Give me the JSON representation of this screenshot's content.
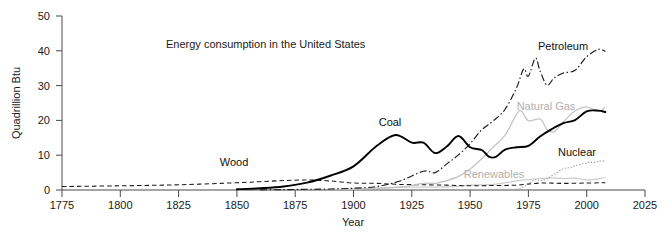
{
  "chart_data": {
    "type": "line",
    "title": "Energy consumption in the United States",
    "xlabel": "Year",
    "ylabel": "Quadrillion Btu",
    "xlim": [
      1775,
      2025
    ],
    "ylim": [
      0,
      50
    ],
    "xticks": [
      1775,
      1800,
      1825,
      1850,
      1875,
      1900,
      1925,
      1950,
      1975,
      2000,
      2025
    ],
    "yticks": [
      0,
      10,
      20,
      30,
      40,
      50
    ],
    "grid": false,
    "legend": "inline-annotations",
    "series": [
      {
        "name": "Wood",
        "label": "Wood",
        "style": "dashed",
        "color": "#1a1a1a",
        "x": [
          1775,
          1800,
          1825,
          1850,
          1860,
          1870,
          1880,
          1890,
          1900,
          1910,
          1920,
          1930,
          1940,
          1950,
          1960,
          1970,
          1980,
          1990,
          2000,
          2008
        ],
        "y": [
          1.0,
          1.2,
          1.5,
          2.1,
          2.4,
          2.7,
          2.9,
          2.6,
          2.0,
          1.9,
          1.6,
          1.5,
          1.4,
          1.2,
          1.3,
          1.4,
          2.0,
          1.9,
          2.0,
          2.1
        ]
      },
      {
        "name": "Coal",
        "label": "Coal",
        "style": "solid-thick",
        "color": "#000000",
        "x": [
          1850,
          1860,
          1870,
          1880,
          1890,
          1900,
          1910,
          1918,
          1925,
          1930,
          1935,
          1940,
          1945,
          1950,
          1955,
          1958,
          1961,
          1965,
          1970,
          1975,
          1980,
          1985,
          1990,
          1995,
          2000,
          2005,
          2008
        ],
        "y": [
          0.2,
          0.5,
          1.0,
          2.1,
          4.1,
          6.8,
          12.7,
          15.8,
          13.6,
          13.6,
          10.6,
          12.5,
          15.5,
          12.3,
          11.5,
          9.6,
          9.5,
          11.6,
          12.3,
          12.7,
          15.4,
          17.5,
          19.2,
          20.1,
          22.6,
          22.8,
          22.4
        ]
      },
      {
        "name": "Petroleum",
        "label": "Petroleum",
        "style": "dash-dot",
        "color": "#1a1a1a",
        "x": [
          1860,
          1870,
          1880,
          1890,
          1900,
          1910,
          1920,
          1930,
          1935,
          1940,
          1945,
          1950,
          1955,
          1960,
          1965,
          1970,
          1973,
          1975,
          1978,
          1980,
          1983,
          1986,
          1990,
          1995,
          2000,
          2005,
          2008
        ],
        "y": [
          0.05,
          0.1,
          0.2,
          0.3,
          0.5,
          1.0,
          2.6,
          5.4,
          5.0,
          7.5,
          10.1,
          13.3,
          17.3,
          19.9,
          23.2,
          29.5,
          34.8,
          32.7,
          37.9,
          34.2,
          30.1,
          32.2,
          33.6,
          34.4,
          38.3,
          40.4,
          39.8
        ]
      },
      {
        "name": "Natural Gas",
        "label": "Natural Gas",
        "style": "solid-light",
        "color": "#c2c2c2",
        "x": [
          1890,
          1900,
          1910,
          1920,
          1930,
          1935,
          1940,
          1945,
          1950,
          1955,
          1960,
          1965,
          1970,
          1972,
          1975,
          1980,
          1983,
          1986,
          1990,
          1995,
          2000,
          2005,
          2008
        ],
        "y": [
          0.15,
          0.25,
          0.5,
          0.8,
          1.9,
          1.9,
          2.7,
          3.9,
          6.0,
          9.0,
          12.4,
          15.8,
          21.8,
          22.7,
          19.9,
          20.4,
          17.4,
          16.7,
          19.6,
          22.7,
          23.9,
          22.6,
          23.8
        ]
      },
      {
        "name": "Nuclear",
        "label": "Nuclear",
        "style": "dotted",
        "color": "#9e9e9e",
        "x": [
          1957,
          1960,
          1965,
          1970,
          1973,
          1975,
          1978,
          1980,
          1983,
          1986,
          1990,
          1993,
          1996,
          1999,
          2001,
          2003,
          2005,
          2008
        ],
        "y": [
          0.0,
          0.01,
          0.04,
          0.24,
          0.91,
          1.9,
          3.0,
          2.7,
          3.2,
          4.5,
          6.1,
          6.5,
          7.2,
          7.6,
          8.0,
          7.9,
          8.2,
          8.4
        ]
      },
      {
        "name": "Renewables",
        "label": "Renewables",
        "style": "solid-light",
        "color": "#cccccc",
        "x": [
          1900,
          1920,
          1940,
          1950,
          1960,
          1970,
          1975,
          1980,
          1985,
          1990,
          1995,
          2000,
          2005,
          2008
        ],
        "y": [
          0.25,
          0.8,
          0.9,
          1.4,
          1.6,
          2.6,
          3.0,
          3.3,
          3.5,
          3.3,
          3.4,
          2.9,
          3.2,
          3.6
        ]
      }
    ],
    "annotations": [
      {
        "text": "Wood",
        "x": 1848,
        "y": 7.2
      },
      {
        "text": "Coal",
        "x": 1902,
        "y": 21.0
      },
      {
        "text": "Petroleum",
        "x": 1988,
        "y": 43.0
      },
      {
        "text": "Natural Gas",
        "x": 1978,
        "y": 26.5
      },
      {
        "text": "Nuclear",
        "x": 1999,
        "y": 10.0
      },
      {
        "text": "Renewables",
        "x": 1968,
        "y": 4.6
      }
    ]
  }
}
